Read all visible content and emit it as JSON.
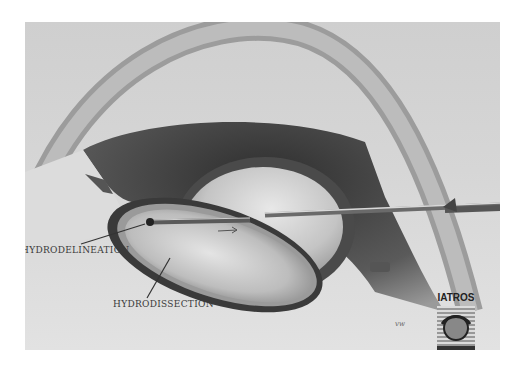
{
  "figure": {
    "labels": [
      {
        "id": "hydrodelineation",
        "text": "HYDRODELINEATION"
      },
      {
        "id": "hydrodissection",
        "text": "HYDRODISSECTION"
      }
    ],
    "logo": {
      "text": "IATROS"
    },
    "signature": "vw"
  },
  "colors": {
    "background": "#d4d4d4",
    "dark_tissue": "#3c3c3c",
    "label_text": "#3a3a3a"
  }
}
